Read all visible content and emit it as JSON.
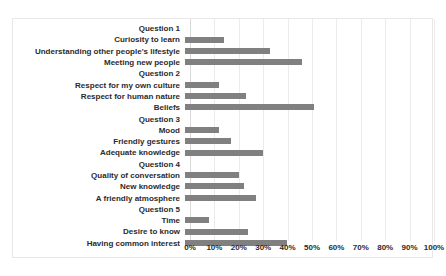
{
  "chart_data": {
    "type": "bar",
    "orientation": "horizontal",
    "title": "",
    "xlabel": "",
    "ylabel": "",
    "xlim": [
      0,
      100
    ],
    "xtick_labels": [
      "0%",
      "10%",
      "20%",
      "30%",
      "40%",
      "50%",
      "60%",
      "70%",
      "80%",
      "90%",
      "100%"
    ],
    "xticks": [
      0,
      10,
      20,
      30,
      40,
      50,
      60,
      70,
      80,
      90,
      100
    ],
    "grid": "vertical",
    "legend": "none",
    "bar_color": "#808080",
    "categories": [
      "Question 1",
      "Curiosity to learn",
      "Understanding other people's lifestyle",
      "Meeting new people",
      "Question 2",
      "Respect for my own culture",
      "Respect for human nature",
      "Beliefs",
      "Question 3",
      "Mood",
      "Friendly gestures",
      "Adequate knowledge",
      "Question 4",
      "Quality of conversation",
      "New knowledge",
      "A friendly atmosphere",
      "Question 5",
      "Time",
      "Desire to know",
      "Having common interest"
    ],
    "values": [
      0,
      16,
      35,
      48,
      0,
      14,
      25,
      53,
      0,
      14,
      19,
      32,
      0,
      22,
      24,
      29,
      0,
      10,
      26,
      42
    ]
  }
}
